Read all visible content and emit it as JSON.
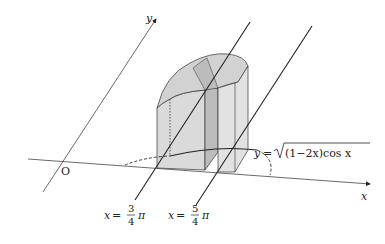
{
  "diagram": {
    "axes": {
      "x_label": "x",
      "y_label": "y",
      "origin_label": "O"
    },
    "curve_label": {
      "lhs": "y",
      "eq": "=",
      "radicand": "(1−2x)cos x"
    },
    "planes": [
      {
        "lhs": "x",
        "eq": "=",
        "numerator": "3",
        "denominator": "4",
        "pi": "π"
      },
      {
        "lhs": "x",
        "eq": "=",
        "numerator": "5",
        "denominator": "4",
        "pi": "π"
      }
    ],
    "colors": {
      "line": "#222222",
      "solid_fill_light": "#dcdcdc",
      "solid_fill_mid": "#c8c8c8",
      "solid_fill_dark": "#b4b4b4"
    }
  }
}
